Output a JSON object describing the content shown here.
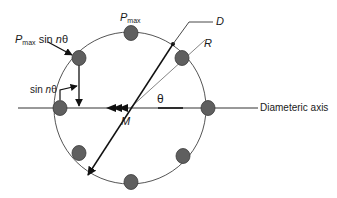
{
  "labels": {
    "p_max_sym": "P",
    "p_max_sub": "max",
    "p_max_sin_sym": "P",
    "p_max_sin_sub": "max",
    "p_max_sin_rest": " sin ",
    "p_max_sin_n": "n",
    "p_max_sin_theta": "θ",
    "sin_word": "sin ",
    "sin_n": "n",
    "sin_theta": "θ",
    "d": "D",
    "r": "R",
    "theta": "θ",
    "m": "M",
    "diametric_axis": "Diameteric axis"
  },
  "colors": {
    "ball_fill": "#5f5f5f",
    "ball_stroke": "#3a3a3a",
    "circle_stroke": "#555555",
    "line": "#111111",
    "thin_line": "#666666"
  },
  "geometry": {
    "center": [
      130,
      108
    ],
    "radius": 76,
    "ball_count": 8
  }
}
